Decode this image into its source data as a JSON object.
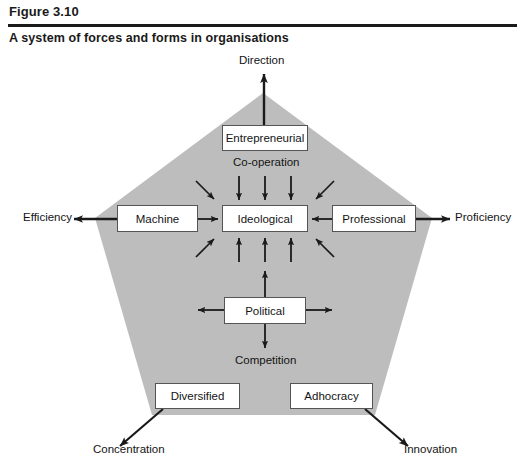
{
  "header": {
    "figure_label": "Figure 3.10",
    "title": "A system of forces and forms in organisations"
  },
  "diagram": {
    "type": "pentagon-force-form-diagram",
    "shape": {
      "name": "pentagon",
      "fill_color": "#bdbdbd",
      "vertices": [
        {
          "name": "top",
          "x": 263,
          "y": 93
        },
        {
          "name": "right",
          "x": 432,
          "y": 218
        },
        {
          "name": "bottom-right",
          "x": 375,
          "y": 415
        },
        {
          "name": "bottom-left",
          "x": 152,
          "y": 415
        },
        {
          "name": "left",
          "x": 95,
          "y": 218
        }
      ]
    },
    "nodes": [
      {
        "id": "entrepreneurial",
        "label": "Entrepreneurial",
        "position": "top"
      },
      {
        "id": "machine",
        "label": "Machine",
        "position": "left"
      },
      {
        "id": "ideological",
        "label": "Ideological",
        "position": "centre"
      },
      {
        "id": "professional",
        "label": "Professional",
        "position": "right"
      },
      {
        "id": "political",
        "label": "Political",
        "position": "below-centre"
      },
      {
        "id": "diversified",
        "label": "Diversified",
        "position": "bottom-left"
      },
      {
        "id": "adhocracy",
        "label": "Adhocracy",
        "position": "bottom-right"
      }
    ],
    "outer_labels": [
      {
        "id": "direction",
        "label": "Direction",
        "from": "entrepreneurial",
        "direction": "up"
      },
      {
        "id": "efficiency",
        "label": "Efficiency",
        "from": "machine",
        "direction": "left"
      },
      {
        "id": "proficiency",
        "label": "Proficiency",
        "from": "professional",
        "direction": "right"
      },
      {
        "id": "concentration",
        "label": "Concentration",
        "from": "diversified",
        "direction": "down-left"
      },
      {
        "id": "innovation",
        "label": "Innovation",
        "from": "adhocracy",
        "direction": "down-right"
      }
    ],
    "inner_labels": [
      {
        "id": "cooperation",
        "label": "Co-operation",
        "meaning": "forces converging on Ideological from above"
      },
      {
        "id": "competition",
        "label": "Competition",
        "meaning": "forces radiating out from Political"
      }
    ],
    "arrow_groups": [
      {
        "id": "converging-on-ideological",
        "target": "ideological",
        "count": 12,
        "style": "inward"
      },
      {
        "id": "radiating-from-political",
        "source": "political",
        "count": 4,
        "style": "outward"
      }
    ]
  }
}
